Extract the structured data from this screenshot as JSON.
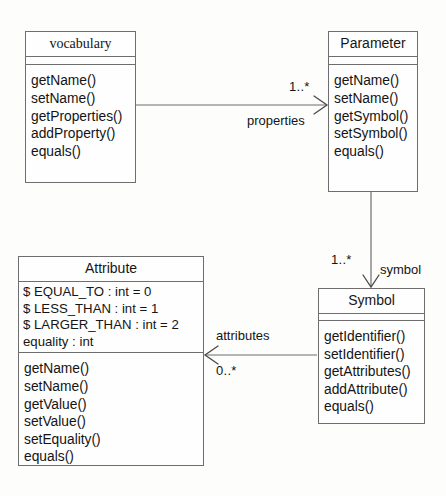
{
  "diagram": {
    "kind": "uml-class-diagram",
    "line_color": "#6e6e6e",
    "text_color": "#141414",
    "background": "#fdfdfc"
  },
  "classes": {
    "vocabulary": {
      "name": "vocabulary",
      "attributes": [],
      "operations": [
        "getName()",
        "setName()",
        "getProperties()",
        "addProperty()",
        "equals()"
      ]
    },
    "parameter": {
      "name": "Parameter",
      "attributes": [],
      "operations": [
        "getName()",
        "setName()",
        "getSymbol()",
        "setSymbol()",
        "equals()"
      ]
    },
    "attribute": {
      "name": "Attribute",
      "attributes": [
        "$ EQUAL_TO : int = 0",
        "$ LESS_THAN : int = 1",
        "$ LARGER_THAN : int = 2",
        "equality : int"
      ],
      "operations": [
        "getName()",
        "setName()",
        "getValue()",
        "setValue()",
        "setEquality()",
        "equals()"
      ]
    },
    "symbol": {
      "name": "Symbol",
      "attributes": [],
      "operations": [
        "getIdentifier()",
        "setIdentifier()",
        "getAttributes()",
        "addAttribute()",
        "equals()"
      ]
    }
  },
  "associations": {
    "vocabulary_parameter": {
      "source": "vocabulary",
      "target": "Parameter",
      "role": "properties",
      "multiplicity": "1..*",
      "direction": "right"
    },
    "parameter_symbol": {
      "source": "Parameter",
      "target": "Symbol",
      "role": "symbol",
      "multiplicity": "1..*",
      "direction": "down"
    },
    "symbol_attribute": {
      "source": "Symbol",
      "target": "Attribute",
      "role": "attributes",
      "multiplicity": "0..*",
      "direction": "left"
    }
  }
}
